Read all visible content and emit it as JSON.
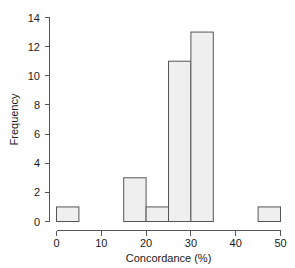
{
  "chart_data": {
    "type": "bar",
    "title": "",
    "xlabel": "Concordance (%)",
    "ylabel": "Frequency",
    "categories": [
      "0-5",
      "5-10",
      "10-15",
      "15-20",
      "20-25",
      "25-30",
      "30-35",
      "35-40",
      "40-45",
      "45-50"
    ],
    "bin_edges": [
      0,
      5,
      10,
      15,
      20,
      25,
      30,
      35,
      40,
      45,
      50
    ],
    "values": [
      1,
      0,
      0,
      3,
      1,
      11,
      13,
      0,
      0,
      1
    ],
    "bin_width": 5,
    "xlim": [
      0,
      50
    ],
    "ylim": [
      0,
      14
    ],
    "xticks": [
      0,
      10,
      20,
      30,
      40,
      50
    ],
    "yticks": [
      0,
      2,
      4,
      6,
      8,
      10,
      12,
      14
    ],
    "xtick_labels": [
      "0",
      "10",
      "20",
      "30",
      "40",
      "50"
    ],
    "ytick_labels": [
      "0",
      "2",
      "4",
      "6",
      "8",
      "10",
      "12",
      "14"
    ],
    "grid": false,
    "legend": null,
    "bar_fill_color": "#efefef",
    "bar_edge_color": "#555555",
    "axis_color": "#555555",
    "text_color": "#1a1a1a",
    "background_color": "#ffffff"
  }
}
